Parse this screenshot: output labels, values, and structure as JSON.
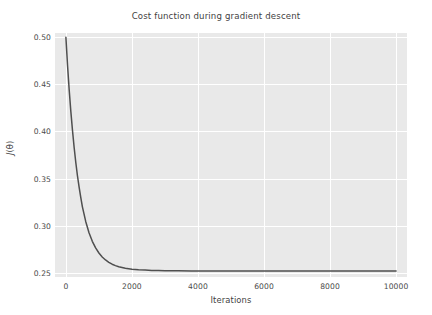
{
  "chart_data": {
    "type": "line",
    "title": "Cost function during gradient descent",
    "xlabel": "Iterations",
    "ylabel": "J(θ)",
    "ylabel_parts": {
      "symbol": "J",
      "arg": "(θ)"
    },
    "grid": true,
    "legend": null,
    "style": "seaborn-darkgrid",
    "xlim": [
      -330,
      10330
    ],
    "ylim": [
      0.2455,
      0.5045
    ],
    "xticks": [
      0,
      2000,
      4000,
      6000,
      8000,
      10000
    ],
    "xtick_labels": [
      "0",
      "2000",
      "4000",
      "6000",
      "8000",
      "10000"
    ],
    "yticks": [
      0.25,
      0.3,
      0.35,
      0.4,
      0.45,
      0.5
    ],
    "ytick_labels": [
      "0.25",
      "0.30",
      "0.35",
      "0.40",
      "0.45",
      "0.50"
    ],
    "series": [
      {
        "name": "cost",
        "color": "#4f4f4f",
        "linewidth": 1.5,
        "start_value": 0.5,
        "plateau_value": 0.26,
        "x": [
          0,
          50,
          100,
          150,
          200,
          250,
          300,
          350,
          400,
          450,
          500,
          600,
          700,
          800,
          900,
          1000,
          1100,
          1200,
          1300,
          1400,
          1500,
          1600,
          1800,
          2000,
          2200,
          2400,
          2600,
          2800,
          3000,
          3400,
          3800,
          4200,
          5000,
          6000,
          7000,
          8000,
          9000,
          10000
        ],
        "y": [
          0.5,
          0.47,
          0.444,
          0.421,
          0.401,
          0.383,
          0.367,
          0.353,
          0.341,
          0.33,
          0.32,
          0.3045,
          0.2925,
          0.2834,
          0.2764,
          0.271,
          0.2668,
          0.2636,
          0.2611,
          0.2591,
          0.2576,
          0.2564,
          0.2548,
          0.2538,
          0.2532,
          0.2528,
          0.2525,
          0.2523,
          0.2522,
          0.2521,
          0.252,
          0.252,
          0.252,
          0.252,
          0.252,
          0.252,
          0.252,
          0.252
        ]
      }
    ],
    "annotations": []
  },
  "colors": {
    "figure_background": "#ffffff",
    "axes_background": "#e9e9e9",
    "gridline": "#ffffff",
    "line": "#4f4f4f",
    "tick_text": "#4a4a4a",
    "label_text": "#3f3f3f"
  }
}
